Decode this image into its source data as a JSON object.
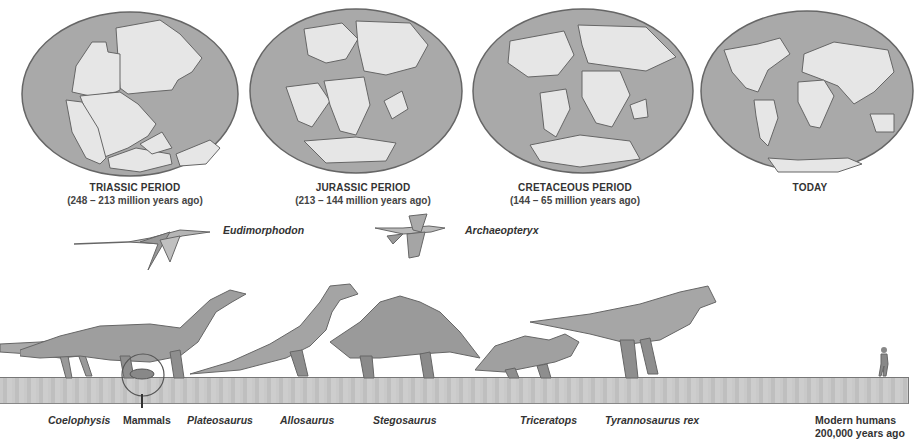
{
  "periods": [
    {
      "title": "TRIASSIC PERIOD",
      "range": "(248 – 213 million years ago)"
    },
    {
      "title": "JURASSIC PERIOD",
      "range": "(213 – 144 million years ago)"
    },
    {
      "title": "CRETACEOUS PERIOD",
      "range": "(144 – 65 million years ago)"
    },
    {
      "title": "TODAY",
      "range": ""
    }
  ],
  "flying": [
    {
      "name": "Eudimorphodon"
    },
    {
      "name": "Archaeopteryx"
    }
  ],
  "ground_species": [
    {
      "name": "Coelophysis"
    },
    {
      "name": "Mammals"
    },
    {
      "name": "Plateosaurus"
    },
    {
      "name": "Allosaurus"
    },
    {
      "name": "Stegosaurus"
    },
    {
      "name": "Triceratops"
    },
    {
      "name": "Tyrannosaurus rex"
    },
    {
      "name": "Modern humans",
      "note": "200,000 years ago"
    }
  ],
  "colors": {
    "ocean": "#a9a9a9",
    "land": "#e6e6e6",
    "outline": "#666666",
    "ground": "#c4c4c4",
    "creature": "#9a9a9a"
  }
}
